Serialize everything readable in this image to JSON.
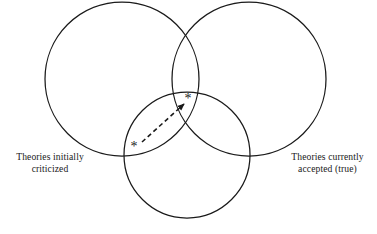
{
  "figure": {
    "type": "venn-diagram",
    "background_color": "#ffffff",
    "stroke_color": "#1a1a1a",
    "title": ""
  },
  "sets": [
    {
      "id": "left",
      "name": "theories-initially-criticized",
      "label_line1": "Theories initially",
      "label_line2": "criticized",
      "cx": 122,
      "cy": 79,
      "r": 77
    },
    {
      "id": "right",
      "name": "theories-currently-accepted",
      "label_line1": "Theories currently",
      "label_line2": "accepted (true)",
      "cx": 249,
      "cy": 79,
      "r": 77
    },
    {
      "id": "bottom",
      "name": "unlabeled-bottom-set",
      "label_line1": "",
      "label_line2": "",
      "cx": 187,
      "cy": 155,
      "r": 63
    }
  ],
  "markers": [
    {
      "id": "marker-lower-left",
      "glyph": "*",
      "x": 134,
      "y": 147,
      "region": "left-bottom-overlap"
    },
    {
      "id": "marker-upper-right",
      "glyph": "*",
      "x": 188,
      "y": 99,
      "region": "triple-overlap"
    }
  ],
  "connector": {
    "id": "dashed-arrow",
    "style": "dashed",
    "from_x": 142,
    "from_y": 142,
    "to_x": 184,
    "to_y": 104,
    "arrowhead": "to"
  },
  "labels": {
    "left": {
      "line1": "Theories initially",
      "line2": "criticized"
    },
    "right": {
      "line1": "Theories currently",
      "line2": "accepted (true)"
    }
  }
}
